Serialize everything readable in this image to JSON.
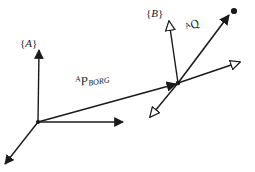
{
  "figure": {
    "background_color": "#ffffff",
    "stroke_color": "#1a1a1a",
    "width": 255,
    "height": 172
  },
  "labels": {
    "frame_a": {
      "open": "{",
      "name": "A",
      "close": "}"
    },
    "frame_b": {
      "open": "{",
      "name": "B",
      "close": "}"
    },
    "p_borg": {
      "pre": "A",
      "base": "P",
      "sub": "BORG"
    },
    "q_vector": {
      "pre": "A",
      "base": "Q"
    }
  },
  "geometry": {
    "origin_a": {
      "x": 38,
      "y": 122
    },
    "origin_b": {
      "x": 178,
      "y": 83
    },
    "point_q": {
      "x": 234,
      "y": 11
    },
    "frame_a_axes": [
      {
        "name": "a-axis-up",
        "x2": 39,
        "y2": 50,
        "head": "solid"
      },
      {
        "name": "a-axis-right",
        "x2": 123,
        "y2": 122,
        "head": "solid"
      },
      {
        "name": "a-axis-down-left",
        "x2": 5,
        "y2": 164,
        "head": "solid"
      }
    ],
    "frame_b_axes": [
      {
        "name": "b-axis-up",
        "x2": 169,
        "y2": 21,
        "head": "open"
      },
      {
        "name": "b-axis-right",
        "x2": 240,
        "y2": 62,
        "head": "open"
      },
      {
        "name": "b-axis-down-left",
        "x2": 150,
        "y2": 117,
        "head": "open"
      }
    ],
    "vectors": [
      {
        "name": "p-borg-vector",
        "x1": 38,
        "y1": 122,
        "x2": 176,
        "y2": 84,
        "head": "solid"
      },
      {
        "name": "q-vector",
        "x1": 178,
        "y1": 83,
        "x2": 229,
        "y2": 15,
        "head": "solid"
      }
    ]
  },
  "label_positions": {
    "frame_a": {
      "left": 20,
      "top": 38
    },
    "frame_b": {
      "left": 146,
      "top": 8
    },
    "p_borg": {
      "left": 77,
      "top": 76
    },
    "q_vector": {
      "left": 190,
      "top": 22
    }
  }
}
